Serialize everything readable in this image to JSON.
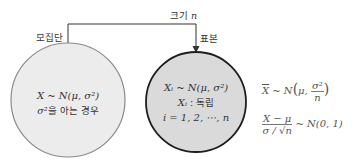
{
  "diagram": {
    "size_label": "크기",
    "size_var": "n",
    "population_label": "모집단",
    "sample_label": "표본",
    "population": {
      "line1": "X ~ N(μ, σ²)",
      "line2_sym": "σ²",
      "line2_text": "을 아는 경우",
      "fill": "#ececec",
      "stroke": "#888888"
    },
    "sample": {
      "line1": "Xᵢ ~ N(μ, σ²)",
      "line2_var": "Xᵢ",
      "line2_text": " : 독립",
      "line3": "i = 1, 2, ⋯, n",
      "fill": "#dcdcdc",
      "stroke": "#222222"
    },
    "formulas": {
      "f1_lhs": "X",
      "f1_mid": " ~ N",
      "f1_mu": "μ, ",
      "f1_num": "σ²",
      "f1_den": "n",
      "f2_num": "X − μ",
      "f2_den": "σ / √n",
      "f2_rhs": " ~ N(0, 1)"
    }
  }
}
